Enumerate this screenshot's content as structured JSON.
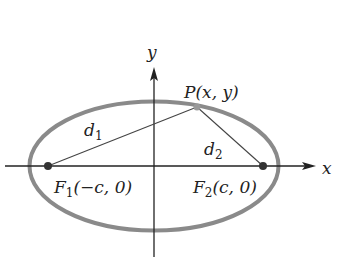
{
  "diagram": {
    "ellipse": {
      "cx": 154,
      "cy": 166,
      "rx": 124.5,
      "ry": 64.5,
      "stroke": "#8a8a8a",
      "stroke_width": 4
    },
    "axes": {
      "x_label": "x",
      "y_label": "y",
      "color": "#222222"
    },
    "point_P": {
      "label": "P(x, y)",
      "x": 197,
      "y": 107
    },
    "focus1": {
      "name": "F",
      "sub": "1",
      "coords": "(−c, 0)",
      "x": 48,
      "y": 166
    },
    "focus2": {
      "name": "F",
      "sub": "2",
      "coords": "(c, 0)",
      "x": 263,
      "y": 166
    },
    "distance1": {
      "name": "d",
      "sub": "1"
    },
    "distance2": {
      "name": "d",
      "sub": "2"
    }
  }
}
